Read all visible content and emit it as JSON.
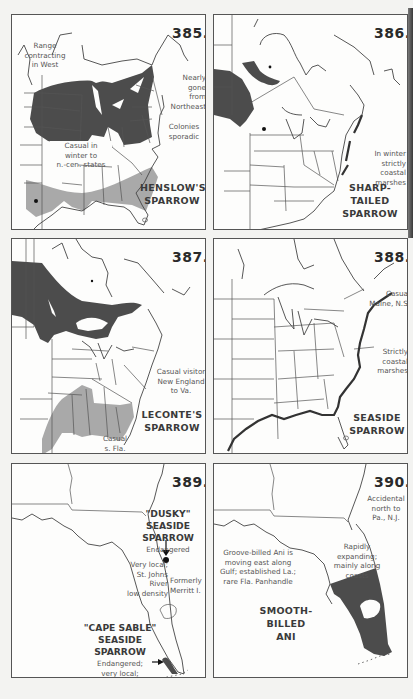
{
  "page": {
    "background": "#f3f3f1",
    "colors": {
      "range_dark": "#4c4c4c",
      "range_light": "#a9a9a9",
      "line": "#555555"
    }
  },
  "maps": [
    {
      "number": "385.",
      "title": [
        "HENSLOW'S",
        "SPARROW"
      ],
      "notes": [
        {
          "id": "west",
          "lines": [
            "Range",
            "contracting",
            "in West"
          ]
        },
        {
          "id": "northeast",
          "lines": [
            "Nearly",
            "gone",
            "from",
            "Northeast"
          ]
        },
        {
          "id": "colonies",
          "lines": [
            "Colonies",
            "sporadic"
          ]
        },
        {
          "id": "winter",
          "lines": [
            "Casual in",
            "winter to",
            "n.-cen. states"
          ]
        }
      ],
      "legend": {
        "dark": "summer range",
        "light": "winter range",
        "dot": "isolated record"
      }
    },
    {
      "number": "386.",
      "title": [
        "SHARP-TAILED",
        "SPARROW"
      ],
      "notes": [
        {
          "id": "winter",
          "lines": [
            "In winter",
            "strictly",
            "coastal",
            "marshes"
          ]
        }
      ]
    },
    {
      "number": "387.",
      "title": [
        "LECONTE'S",
        "SPARROW"
      ],
      "notes": [
        {
          "id": "casual-ne",
          "lines": [
            "Casual visitor",
            "New England",
            "to Va."
          ]
        },
        {
          "id": "casual-fla",
          "lines": [
            "Casual",
            "s. Fla."
          ]
        }
      ]
    },
    {
      "number": "388.",
      "title": [
        "SEASIDE",
        "SPARROW"
      ],
      "notes": [
        {
          "id": "casual",
          "lines": [
            "Casual",
            "Maine, N.S."
          ]
        },
        {
          "id": "coastal",
          "lines": [
            "Strictly",
            "coastal",
            "marshes"
          ]
        }
      ]
    },
    {
      "number": "389.",
      "title": [],
      "notes": [
        {
          "id": "dusky-title",
          "lines": [
            "\"DUSKY\"",
            "SEASIDE",
            "SPARROW"
          ]
        },
        {
          "id": "dusky-status",
          "lines": [
            "Endangered"
          ]
        },
        {
          "id": "st-johns",
          "lines": [
            "Very local;",
            "St. Johns",
            "River",
            "low density"
          ]
        },
        {
          "id": "merritt",
          "lines": [
            "Formerly",
            "Merritt I."
          ]
        },
        {
          "id": "cape-sable-title",
          "lines": [
            "\"CAPE SABLE\"",
            "SEASIDE",
            "SPARROW"
          ]
        },
        {
          "id": "cape-sable-status",
          "lines": [
            "Endangered;",
            "very local;",
            "low density"
          ]
        }
      ]
    },
    {
      "number": "390.",
      "title": [
        "SMOOTH-",
        "BILLED",
        "ANI"
      ],
      "notes": [
        {
          "id": "accidental",
          "lines": [
            "Accidental",
            "north to",
            "Pa., N.J."
          ]
        },
        {
          "id": "expanding",
          "lines": [
            "Rapidly",
            "expanding;",
            "mainly along",
            "coasts"
          ]
        },
        {
          "id": "groove",
          "lines": [
            "Groove-billed Ani is",
            "moving east along",
            "Gulf; established La.;",
            "rare Fla. Panhandle"
          ]
        }
      ]
    }
  ]
}
